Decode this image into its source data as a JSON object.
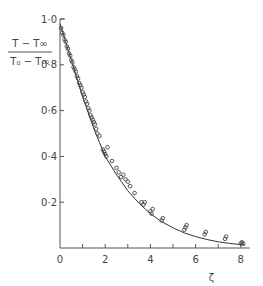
{
  "chart_data": {
    "type": "scatter",
    "title": "",
    "xlabel": "ζ",
    "ylabel_numerator": "T − T∞",
    "ylabel_denominator": "T₀ − T∞",
    "xlim": [
      0,
      8.2
    ],
    "ylim": [
      0,
      1.0
    ],
    "grid": false,
    "legend": null,
    "x_ticks": [
      0,
      2,
      4,
      6,
      8
    ],
    "x_minor_ticks": [
      1,
      3,
      5,
      7
    ],
    "x_tick_labels": [
      "0",
      "2",
      "4",
      "6",
      "8"
    ],
    "y_ticks": [
      0.2,
      0.4,
      0.6,
      0.8,
      1.0
    ],
    "y_tick_labels": [
      "0·2",
      "0·4",
      "0·6",
      "0·8",
      "1·0"
    ],
    "series": [
      {
        "name": "theory",
        "kind": "line",
        "x": [
          0,
          0.25,
          0.5,
          0.75,
          1.0,
          1.25,
          1.5,
          1.75,
          2.0,
          2.5,
          3.0,
          3.5,
          4.0,
          4.5,
          5.0,
          5.5,
          6.0,
          6.5,
          7.0,
          7.5,
          8.0,
          8.2
        ],
        "y": [
          0.98,
          0.9,
          0.82,
          0.74,
          0.66,
          0.59,
          0.52,
          0.46,
          0.4,
          0.32,
          0.25,
          0.195,
          0.15,
          0.115,
          0.088,
          0.066,
          0.05,
          0.037,
          0.027,
          0.02,
          0.015,
          0.013
        ]
      },
      {
        "name": "experiment",
        "kind": "scatter",
        "marker": "open-circle",
        "x": [
          0.05,
          0.1,
          0.15,
          0.2,
          0.25,
          0.3,
          0.35,
          0.4,
          0.45,
          0.5,
          0.55,
          0.6,
          0.65,
          0.7,
          0.75,
          0.8,
          0.85,
          0.9,
          0.95,
          1.0,
          1.05,
          1.1,
          1.15,
          1.2,
          1.25,
          1.3,
          1.35,
          1.4,
          1.45,
          1.5,
          1.55,
          1.6,
          1.65,
          1.75,
          1.9,
          1.95,
          2.0,
          2.05,
          2.1,
          2.3,
          2.5,
          2.6,
          2.7,
          2.8,
          2.9,
          3.0,
          3.1,
          3.3,
          3.6,
          3.7,
          3.75,
          4.0,
          4.05,
          4.1,
          4.5,
          4.55,
          5.5,
          5.55,
          5.6,
          6.4,
          6.45,
          7.3,
          7.35,
          8.0,
          8.05,
          8.1
        ],
        "y": [
          0.96,
          0.94,
          0.93,
          0.91,
          0.9,
          0.88,
          0.87,
          0.85,
          0.84,
          0.82,
          0.81,
          0.79,
          0.78,
          0.77,
          0.75,
          0.74,
          0.72,
          0.71,
          0.7,
          0.68,
          0.67,
          0.66,
          0.64,
          0.63,
          0.61,
          0.6,
          0.58,
          0.57,
          0.56,
          0.55,
          0.54,
          0.52,
          0.5,
          0.49,
          0.43,
          0.42,
          0.41,
          0.4,
          0.44,
          0.38,
          0.35,
          0.33,
          0.31,
          0.32,
          0.3,
          0.29,
          0.27,
          0.24,
          0.2,
          0.19,
          0.2,
          0.16,
          0.15,
          0.17,
          0.12,
          0.13,
          0.08,
          0.09,
          0.1,
          0.06,
          0.07,
          0.04,
          0.05,
          0.02,
          0.025,
          0.02
        ]
      }
    ]
  }
}
